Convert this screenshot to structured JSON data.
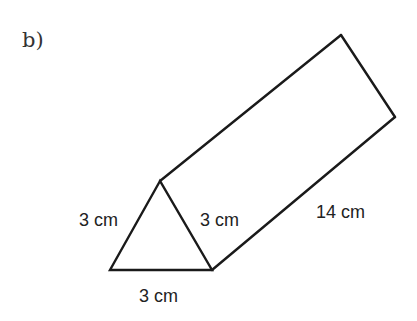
{
  "part_label": "b)",
  "figure": {
    "shape": "triangular prism",
    "stroke_color": "#1a1a1a",
    "labels": {
      "front_left_edge": "3 cm",
      "front_right_edge": "3 cm",
      "front_bottom_edge": "3 cm",
      "length_edge": "14 cm"
    }
  }
}
